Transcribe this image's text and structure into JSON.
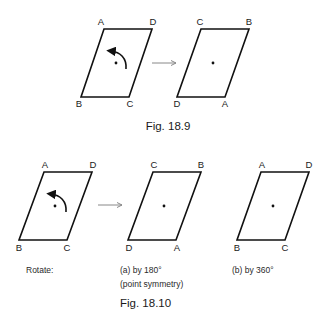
{
  "fig_18_9": {
    "caption": "Fig. 18.9",
    "left": {
      "top_left": "A",
      "top_right": "D",
      "bottom_left": "B",
      "bottom_right": "C"
    },
    "right": {
      "top_left": "C",
      "top_right": "B",
      "bottom_left": "D",
      "bottom_right": "A"
    }
  },
  "fig_18_10": {
    "caption": "Fig. 18.10",
    "rotate_label": "Rotate:",
    "shape1": {
      "top_left": "A",
      "top_right": "D",
      "bottom_left": "B",
      "bottom_right": "C"
    },
    "shape2": {
      "top_left": "C",
      "top_right": "B",
      "bottom_left": "D",
      "bottom_right": "A",
      "label": "(a) by 180°",
      "sublabel": "(point symmetry)"
    },
    "shape3": {
      "top_left": "A",
      "top_right": "D",
      "bottom_left": "B",
      "bottom_right": "C",
      "label": "(b) by 360°"
    }
  },
  "colors": {
    "stroke": "#111111",
    "arrow": "#888888"
  }
}
